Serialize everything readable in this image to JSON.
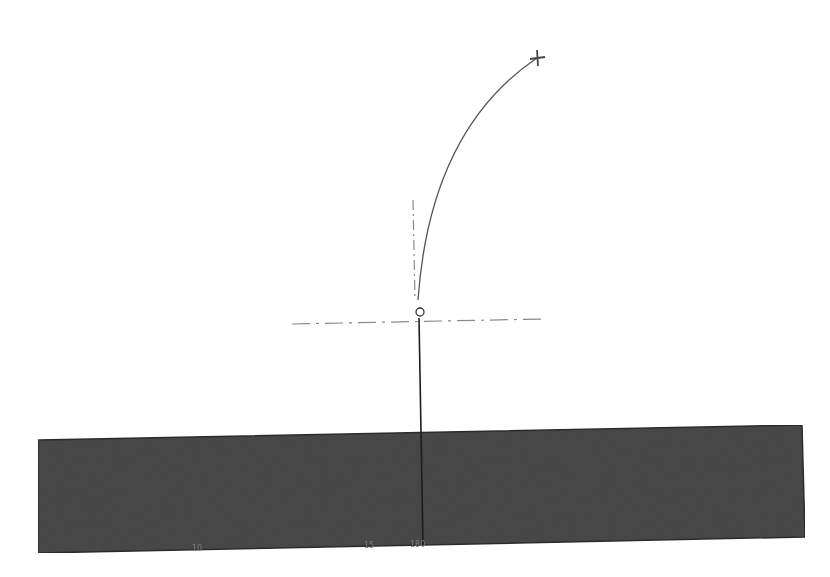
{
  "drawing": {
    "type": "technical-sketch",
    "background": "#ffffff",
    "base_block": {
      "fill": "#4a4a4a",
      "edge": "#2e2e2e",
      "corners": [
        [
          38,
          440
        ],
        [
          802,
          425
        ],
        [
          805,
          537
        ],
        [
          38,
          553
        ]
      ]
    },
    "vertical_member": {
      "color": "#1e1e1e",
      "from": [
        419,
        318
      ],
      "to": [
        423,
        545
      ]
    },
    "curve": {
      "color": "#555555",
      "start": [
        418,
        300
      ],
      "control": [
        430,
        130
      ],
      "end": [
        537,
        58
      ]
    },
    "end_marker": {
      "shape": "cross-plus",
      "at": [
        537,
        58
      ],
      "color": "#444444"
    },
    "pivot_marker": {
      "shape": "small-circle",
      "at": [
        420,
        312
      ],
      "color": "#333333"
    },
    "centerline_vertical": {
      "style": "dash-dot",
      "color": "#8a8a8a",
      "from": [
        413,
        200
      ],
      "to": [
        415,
        300
      ]
    },
    "centerline_horizontal": {
      "style": "dash-dot",
      "color": "#8a8a8a",
      "from": [
        292,
        324
      ],
      "to": [
        543,
        319
      ]
    },
    "bottom_labels": [
      {
        "text": "10",
        "x": 196,
        "y": 544
      },
      {
        "text": "15",
        "x": 367,
        "y": 541
      },
      {
        "text": "180",
        "x": 414,
        "y": 540
      }
    ]
  }
}
